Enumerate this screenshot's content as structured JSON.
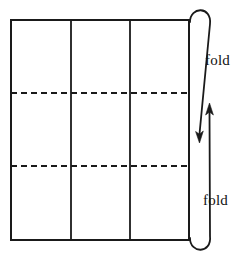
{
  "diagram": {
    "type": "origami-fold-instruction",
    "background_color": "#ffffff",
    "stroke_color": "#1a1a1a",
    "labels": {
      "top_fold": "fold",
      "bottom_fold": "fold"
    },
    "sheet": {
      "name": "paper-sheet",
      "x": 11,
      "y": 20,
      "width": 178,
      "height": 220,
      "stroke_width": 2.0
    },
    "vertical_creases": {
      "name": "column-divider-lines",
      "style": "solid",
      "x_positions": [
        71,
        130
      ],
      "stroke_width": 1.8
    },
    "horizontal_creases": {
      "name": "fold-crease-lines",
      "style": "dashed",
      "y_positions": [
        93,
        166
      ],
      "dash_pattern": "6 4",
      "stroke_width": 1.8
    },
    "arrows": {
      "top_arrow": {
        "name": "top-fold-arrow",
        "direction": "down",
        "description": "curves over top-right edge then points downward",
        "head_x": 199,
        "head_y": 141
      },
      "bottom_arrow": {
        "name": "bottom-fold-arrow",
        "direction": "up",
        "description": "curves under bottom-right edge then points upward",
        "head_x": 209,
        "head_y": 104
      }
    }
  }
}
